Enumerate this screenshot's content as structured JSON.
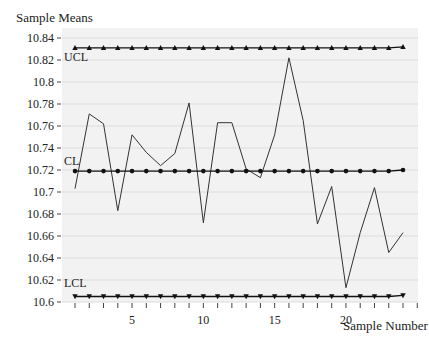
{
  "chart_data": {
    "type": "line",
    "title": "",
    "xlabel": "Sample Number",
    "ylabel": "Sample Means",
    "x": [
      1,
      2,
      3,
      4,
      5,
      6,
      7,
      8,
      9,
      10,
      11,
      12,
      13,
      14,
      15,
      16,
      17,
      18,
      19,
      20,
      21,
      22,
      23,
      24
    ],
    "series": [
      {
        "name": "Sample Means",
        "values": [
          10.703,
          10.771,
          10.762,
          10.683,
          10.752,
          10.736,
          10.724,
          10.735,
          10.781,
          10.672,
          10.763,
          10.763,
          10.721,
          10.713,
          10.752,
          10.822,
          10.765,
          10.671,
          10.705,
          10.613,
          10.663,
          10.704,
          10.645,
          10.663
        ]
      },
      {
        "name": "UCL",
        "values": [
          10.831,
          10.831,
          10.831,
          10.831,
          10.831,
          10.831,
          10.831,
          10.831,
          10.831,
          10.831,
          10.831,
          10.831,
          10.831,
          10.831,
          10.831,
          10.831,
          10.831,
          10.831,
          10.831,
          10.831,
          10.831,
          10.831,
          10.831,
          10.832
        ],
        "marker": "triangle-up"
      },
      {
        "name": "CL",
        "values": [
          10.719,
          10.719,
          10.719,
          10.719,
          10.719,
          10.719,
          10.719,
          10.719,
          10.719,
          10.719,
          10.719,
          10.719,
          10.719,
          10.719,
          10.719,
          10.719,
          10.719,
          10.719,
          10.719,
          10.719,
          10.719,
          10.719,
          10.719,
          10.72
        ],
        "marker": "circle"
      },
      {
        "name": "LCL",
        "values": [
          10.605,
          10.605,
          10.605,
          10.605,
          10.605,
          10.605,
          10.605,
          10.605,
          10.605,
          10.605,
          10.605,
          10.605,
          10.605,
          10.605,
          10.605,
          10.605,
          10.605,
          10.605,
          10.605,
          10.605,
          10.605,
          10.605,
          10.605,
          10.606
        ],
        "marker": "triangle-down"
      }
    ],
    "ylim": [
      10.6,
      10.84
    ],
    "xlim": [
      0,
      25
    ],
    "yticks": [
      "10.84",
      "10.82",
      "10.8",
      "10.78",
      "10.76",
      "10.74",
      "10.72",
      "10.7",
      "10.68",
      "10.66",
      "10.64",
      "10.62",
      "10.6"
    ],
    "xticks": [
      "5",
      "10",
      "15",
      "20"
    ],
    "annotations": [
      "UCL",
      "CL",
      "LCL"
    ],
    "grid": true,
    "legend": "none"
  },
  "labels": {
    "y_title": "Sample Means",
    "x_title": "Sample Number",
    "ucl": "UCL",
    "cl": "CL",
    "lcl": "LCL"
  }
}
